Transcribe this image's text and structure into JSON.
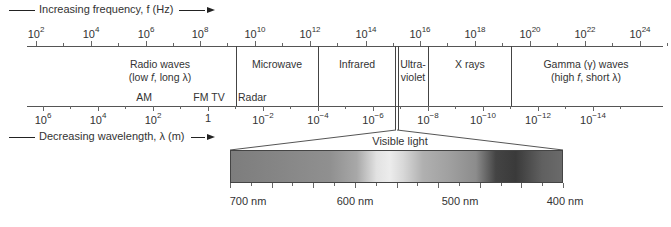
{
  "frequency_axis": {
    "caption": "Increasing frequency, f (Hz)",
    "caption_prefix": "Increasing frequency, ",
    "caption_var": "f",
    "caption_unit": " (Hz)",
    "ticks": [
      {
        "base": "10",
        "exp": "2",
        "x": 36
      },
      {
        "base": "10",
        "exp": "4",
        "x": 91
      },
      {
        "base": "10",
        "exp": "6",
        "x": 146
      },
      {
        "base": "10",
        "exp": "8",
        "x": 200
      },
      {
        "base": "10",
        "exp": "10",
        "x": 255
      },
      {
        "base": "10",
        "exp": "12",
        "x": 310
      },
      {
        "base": "10",
        "exp": "14",
        "x": 366
      },
      {
        "base": "10",
        "exp": "16",
        "x": 420
      },
      {
        "base": "10",
        "exp": "18",
        "x": 475
      },
      {
        "base": "10",
        "exp": "20",
        "x": 530
      },
      {
        "base": "10",
        "exp": "22",
        "x": 585
      },
      {
        "base": "10",
        "exp": "24",
        "x": 640
      }
    ]
  },
  "wavelength_axis": {
    "caption": "Decreasing wavelength, λ (m)",
    "ticks": [
      {
        "base": "10",
        "exp": "6",
        "x": 43
      },
      {
        "base": "10",
        "exp": "4",
        "x": 98
      },
      {
        "base": "10",
        "exp": "2",
        "x": 153
      },
      {
        "base": "1",
        "exp": "",
        "x": 208
      },
      {
        "base": "10",
        "exp": "−2",
        "x": 263
      },
      {
        "base": "10",
        "exp": "−4",
        "x": 318
      },
      {
        "base": "10",
        "exp": "−6",
        "x": 373
      },
      {
        "base": "10",
        "exp": "−8",
        "x": 428
      },
      {
        "base": "10",
        "exp": "−10",
        "x": 483
      },
      {
        "base": "10",
        "exp": "−12",
        "x": 538
      },
      {
        "base": "10",
        "exp": "−14",
        "x": 593
      }
    ]
  },
  "regions": [
    {
      "name": "Radio waves",
      "line1": "Radio waves",
      "line2": "(low f, long λ)"
    },
    {
      "name": "Microwave",
      "line1": "Microwave",
      "line2": ""
    },
    {
      "name": "Infrared",
      "line1": "Infrared",
      "line2": ""
    },
    {
      "name": "Ultraviolet",
      "line1": "Ultra-",
      "line2": "violet"
    },
    {
      "name": "X rays",
      "line1": "X rays",
      "line2": ""
    },
    {
      "name": "Gamma waves",
      "line1": "Gamma (γ) waves",
      "line2": "(high f, short λ)"
    }
  ],
  "sub_labels": {
    "am": "AM",
    "fm_tv": "FM TV",
    "radar": "Radar"
  },
  "visible": {
    "title": "Visible light",
    "labels": [
      "700 nm",
      "600 nm",
      "500 nm",
      "400 nm"
    ]
  }
}
